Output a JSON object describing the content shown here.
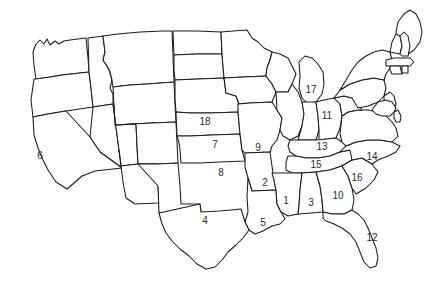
{
  "figure": {
    "kind": "map",
    "title": "",
    "region": "United States (contiguous 48 states)",
    "background_color": "#ffffff",
    "outline_color": "#1a1a1a",
    "label_color": "#2b2b2b",
    "numbered_state_count": 18
  },
  "labels": [
    {
      "text": "1",
      "x": 286,
      "y": 201,
      "name": "state-number-1"
    },
    {
      "text": "2",
      "x": 265,
      "y": 183,
      "name": "state-number-2"
    },
    {
      "text": "3",
      "x": 311,
      "y": 203,
      "name": "state-number-3"
    },
    {
      "text": "4",
      "x": 205,
      "y": 221,
      "name": "state-number-4"
    },
    {
      "text": "5",
      "x": 263,
      "y": 223,
      "name": "state-number-5"
    },
    {
      "text": "6",
      "x": 40,
      "y": 156,
      "name": "state-number-6"
    },
    {
      "text": "7",
      "x": 215,
      "y": 145,
      "name": "state-number-7"
    },
    {
      "text": "8",
      "x": 221,
      "y": 173,
      "name": "state-number-8"
    },
    {
      "text": "9",
      "x": 258,
      "y": 148,
      "name": "state-number-9"
    },
    {
      "text": "10",
      "x": 338,
      "y": 196,
      "name": "state-number-10"
    },
    {
      "text": "11",
      "x": 327,
      "y": 116,
      "name": "state-number-11"
    },
    {
      "text": "12",
      "x": 372,
      "y": 238,
      "name": "state-number-12"
    },
    {
      "text": "13",
      "x": 322,
      "y": 147,
      "name": "state-number-13"
    },
    {
      "text": "14",
      "x": 372,
      "y": 157,
      "name": "state-number-14"
    },
    {
      "text": "15",
      "x": 316,
      "y": 165,
      "name": "state-number-15"
    },
    {
      "text": "16",
      "x": 357,
      "y": 178,
      "name": "state-number-16"
    },
    {
      "text": "17",
      "x": 311,
      "y": 90,
      "name": "state-number-17"
    },
    {
      "text": "18",
      "x": 205,
      "y": 122,
      "name": "state-number-18"
    }
  ],
  "shapes": [
    {
      "name": "state-washington",
      "d": "M33,52 L36,44 L40,40 L44,44 L47,39 L50,45 L55,41 L59,44 L64,41 L70,40 L78,39 L86,38 L88,58 L89,72 L62,75 L50,77 L36,79 L34,66 Z"
    },
    {
      "name": "state-oregon",
      "d": "M34,79 L36,79 L50,77 L62,75 L89,72 L91,88 L93,107 L66,111 L48,114 L33,117 L31,100 Z"
    },
    {
      "name": "state-idaho",
      "d": "M88,38 L96,37 L103,36 L105,52 L103,60 L107,66 L110,72 L112,80 L110,88 L113,94 L113,104 L93,107 L91,88 L89,72 Z"
    },
    {
      "name": "state-montana",
      "d": "M103,36 L118,34 L140,32 L163,31 L172,31 L173,56 L174,82 L147,84 L130,85 L113,87 L112,80 L110,72 L107,66 L103,60 L105,52 Z"
    },
    {
      "name": "state-wyoming",
      "d": "M113,87 L130,85 L147,84 L174,82 L175,104 L176,122 L152,123 L132,124 L115,125 L114,106 Z"
    },
    {
      "name": "state-north-dakota",
      "d": "M173,31 L197,31 L221,32 L222,54 L197,54 L174,55 Z"
    },
    {
      "name": "state-south-dakota",
      "d": "M174,55 L197,54 L222,54 L224,78 L198,79 L175,80 L174,70 Z"
    },
    {
      "name": "state-nebraska",
      "d": "M175,80 L198,79 L224,78 L226,93 L236,96 L239,104 L238,112 L210,113 L190,113 L176,112 L175,99 Z"
    },
    {
      "name": "state-nevada",
      "d": "M93,107 L113,104 L116,127 L119,150 L122,168 L100,152 L90,137 Z"
    },
    {
      "name": "state-utah",
      "d": "M113,104 L114,106 L115,125 L136,124 L137,146 L138,164 L121,166 L119,150 L116,127 Z"
    },
    {
      "name": "state-colorado",
      "d": "M115,125 L132,124 L152,123 L176,122 L177,143 L178,163 L157,164 L138,164 L137,146 L136,124 Z"
    },
    {
      "name": "state-california",
      "d": "M33,117 L48,114 L66,111 L90,137 L100,152 L122,168 L95,171 L82,176 L74,183 L67,189 L56,182 L48,170 L43,160 L38,148 L34,135 Z"
    },
    {
      "name": "state-arizona",
      "d": "M119,150 L121,166 L138,164 L157,164 L158,186 L159,203 L135,204 L126,198 L123,182 L121,166 Z"
    },
    {
      "name": "state-new-mexico",
      "d": "M138,164 L157,164 L178,163 L180,186 L181,204 L200,204 L201,212 L159,213 L158,186 Z"
    },
    {
      "name": "state-kansas",
      "d": "M176,112 L190,113 L210,113 L238,112 L240,134 L212,135 L190,136 L177,136 Z"
    },
    {
      "name": "state-oklahoma",
      "d": "M177,136 L190,136 L212,135 L240,134 L242,150 L245,161 L219,162 L200,163 L181,163 L180,150 L179,143 Z"
    },
    {
      "name": "state-minnesota",
      "d": "M221,32 L233,31 L247,30 L252,38 L258,42 L264,48 L272,52 L270,60 L267,68 L266,76 L244,77 L224,78 L222,54 Z"
    },
    {
      "name": "state-iowa",
      "d": "M224,78 L244,77 L266,76 L272,84 L276,92 L272,102 L250,103 L238,104 L239,104 L236,96 L226,93 Z"
    },
    {
      "name": "state-missouri",
      "d": "M238,112 L238,104 L250,103 L272,102 L277,110 L282,118 L280,130 L277,140 L272,146 L270,152 L245,153 L242,150 L240,134 Z"
    },
    {
      "name": "state-arkansas",
      "d": "M245,153 L270,152 L272,166 L274,180 L276,190 L252,191 L248,178 L245,167 Z"
    },
    {
      "name": "state-louisiana",
      "d": "M248,178 L252,191 L276,190 L277,204 L281,212 L285,219 L280,224 L272,226 L263,231 L255,234 L249,230 L245,222 L248,212 L247,196 Z"
    },
    {
      "name": "state-texas",
      "d": "M159,213 L200,204 L201,212 L219,211 L231,210 L241,209 L245,222 L249,230 L243,238 L236,245 L228,252 L222,260 L215,267 L206,269 L197,264 L189,256 L180,249 L172,241 L166,233 L162,224 Z"
    },
    {
      "name": "state-wisconsin",
      "d": "M266,76 L267,68 L270,60 L272,52 L280,54 L288,58 L292,66 L296,74 L292,84 L288,92 L276,92 L272,84 Z"
    },
    {
      "name": "state-michigan",
      "d": "M299,62 L305,56 L312,58 L318,64 L323,72 L324,84 L322,94 L316,102 L308,104 L302,98 L299,88 L300,76 Z"
    },
    {
      "name": "state-illinois",
      "d": "M276,92 L288,92 L292,84 L298,92 L302,102 L304,114 L302,126 L298,136 L290,140 L283,136 L280,130 L282,118 L277,110 Z"
    },
    {
      "name": "state-indiana",
      "d": "M302,102 L316,102 L318,116 L319,130 L316,140 L298,140 L302,126 L304,114 Z"
    },
    {
      "name": "state-ohio",
      "d": "M316,102 L324,100 L334,98 L340,104 L342,116 L340,128 L336,138 L319,140 L319,130 L318,116 Z"
    },
    {
      "name": "state-kentucky",
      "d": "M290,140 L298,140 L316,140 L336,138 L342,142 L346,146 L340,152 L330,156 L318,158 L306,158 L296,156 L290,152 L288,146 Z"
    },
    {
      "name": "state-tennessee",
      "d": "M288,156 L296,156 L306,158 L318,158 L330,156 L340,152 L350,150 L356,152 L352,160 L342,166 L330,170 L316,172 L302,173 L292,173 L286,170 L286,162 Z"
    },
    {
      "name": "state-mississippi",
      "d": "M276,190 L274,180 L272,173 L292,173 L302,173 L300,190 L299,206 L298,214 L288,216 L281,212 L277,204 Z"
    },
    {
      "name": "state-alabama",
      "d": "M300,190 L302,173 L316,172 L320,186 L322,200 L323,212 L312,213 L298,214 L299,206 Z"
    },
    {
      "name": "state-georgia",
      "d": "M322,200 L320,186 L316,172 L330,170 L342,166 L348,176 L352,188 L354,200 L352,210 L344,214 L332,214 L323,212 Z"
    },
    {
      "name": "state-florida",
      "d": "M323,212 L332,214 L344,214 L352,210 L358,214 L364,220 L368,228 L372,238 L376,248 L378,258 L376,266 L370,268 L364,262 L360,252 L356,242 L350,234 L342,228 L334,224 L326,221 L323,218 Z"
    },
    {
      "name": "state-south-carolina",
      "d": "M342,166 L352,160 L362,158 L372,164 L378,172 L374,180 L366,188 L356,194 L352,188 L348,176 Z"
    },
    {
      "name": "state-north-carolina",
      "d": "M340,152 L346,146 L356,142 L368,140 L380,140 L392,142 L400,146 L396,152 L388,156 L378,160 L372,164 L362,158 L352,160 L350,150 Z"
    },
    {
      "name": "state-virginia",
      "d": "M342,116 L348,112 L358,110 L368,110 L378,112 L386,116 L392,122 L396,128 L398,136 L392,142 L380,140 L368,140 L356,142 L346,146 L342,142 L340,134 Z"
    },
    {
      "name": "state-west-virginia",
      "d": "M334,98 L344,96 L352,98 L358,104 L362,110 L358,110 L348,112 L342,116 L340,104 Z"
    },
    {
      "name": "state-pennsylvania",
      "d": "M334,98 L340,90 L350,84 L362,80 L374,78 L384,80 L386,88 L384,96 L378,102 L368,106 L358,108 L352,98 L344,96 Z"
    },
    {
      "name": "state-new-york",
      "d": "M340,90 L346,80 L352,70 L358,62 L366,56 L374,52 L382,50 L390,52 L392,60 L390,68 L386,74 L384,80 L374,78 L362,80 L350,84 Z"
    },
    {
      "name": "state-maine",
      "d": "M398,22 L404,14 L410,10 L416,14 L420,22 L422,32 L420,42 L414,50 L408,54 L402,50 L398,42 L396,32 Z"
    },
    {
      "name": "state-vermont",
      "d": "M390,52 L392,42 L396,34 L400,36 L402,46 L400,54 Z"
    },
    {
      "name": "state-new-hampshire",
      "d": "M400,36 L404,32 L408,36 L410,46 L408,56 L402,56 L400,54 L402,46 Z"
    },
    {
      "name": "state-massachusetts",
      "d": "M386,60 L394,58 L402,58 L410,58 L414,62 L410,66 L400,66 L392,66 L386,66 Z"
    },
    {
      "name": "state-connecticut",
      "d": "M390,66 L400,66 L402,74 L392,74 L390,70 Z"
    },
    {
      "name": "state-rhode-island",
      "d": "M402,66 L408,66 L408,73 L402,73 Z"
    },
    {
      "name": "state-new-jersey",
      "d": "M384,96 L390,92 L394,96 L396,104 L394,112 L390,116 L386,112 L384,104 Z"
    },
    {
      "name": "state-delaware",
      "d": "M394,112 L398,110 L401,116 L400,122 L396,122 L394,118 Z"
    },
    {
      "name": "state-maryland",
      "d": "M378,102 L386,100 L392,102 L396,108 L394,112 L390,116 L382,116 L376,114 L372,110 Z"
    }
  ]
}
